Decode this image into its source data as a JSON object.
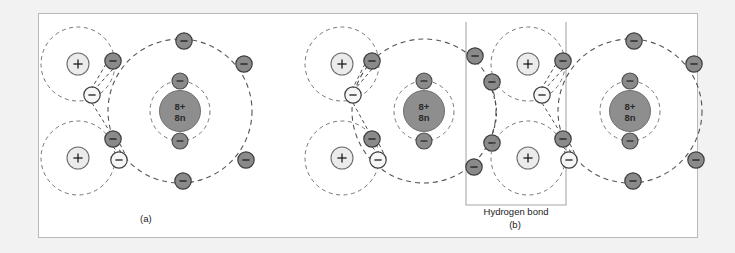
{
  "figure": {
    "background_color": "#f2f2f2",
    "panel_color": "#ffffff",
    "panel_border_color": "#b9b9b9",
    "ink_color": "#2b2b2b"
  },
  "colors": {
    "oxygen_nucleus_fill": "#8e8e8e",
    "oxygen_electron_fill": "#8a8a8a",
    "hydrogen_proton_fill": "#ebebeb",
    "hydrogen_electron_fill": "#f4f4f4",
    "orbit_stroke": "#555555",
    "bracket_stroke": "#a8a8a8"
  },
  "panels": [
    {
      "id": "panel-a",
      "caption": "(a)",
      "molecules": [
        {
          "id": "water-a-1",
          "oxygen": {
            "nucleus_label_line1": "8+",
            "nucleus_label_line2": "8n",
            "inner_shell_electrons": 2,
            "outer_shell_electrons": 6
          },
          "hydrogens": [
            {
              "id": "hydrogen-a-upper",
              "proton_label": "+",
              "electron_label": "−"
            },
            {
              "id": "hydrogen-a-lower",
              "proton_label": "+",
              "electron_label": "−"
            }
          ]
        }
      ]
    },
    {
      "id": "panel-b",
      "caption": "(b)",
      "annotation": "Hydrogen bond",
      "molecules": [
        {
          "id": "water-b-1",
          "oxygen": {
            "nucleus_label_line1": "8+",
            "nucleus_label_line2": "8n",
            "inner_shell_electrons": 2,
            "outer_shell_electrons": 6
          },
          "hydrogens": [
            {
              "id": "hydrogen-b1-upper",
              "proton_label": "+",
              "electron_label": "−"
            },
            {
              "id": "hydrogen-b1-lower",
              "proton_label": "+",
              "electron_label": "−"
            }
          ]
        },
        {
          "id": "water-b-2",
          "oxygen": {
            "nucleus_label_line1": "8+",
            "nucleus_label_line2": "8n",
            "inner_shell_electrons": 2,
            "outer_shell_electrons": 6
          },
          "hydrogens": [
            {
              "id": "hydrogen-b2-upper",
              "proton_label": "+",
              "electron_label": "−"
            },
            {
              "id": "hydrogen-b2-lower",
              "proton_label": "+",
              "electron_label": "−"
            }
          ]
        }
      ]
    }
  ],
  "labels": {
    "electron_sign": "−",
    "proton_sign": "+",
    "nucleus_protons": "8+",
    "nucleus_neutrons": "8n",
    "caption_a": "(a)",
    "caption_b": "(b)",
    "hydrogen_bond": "Hydrogen bond"
  }
}
